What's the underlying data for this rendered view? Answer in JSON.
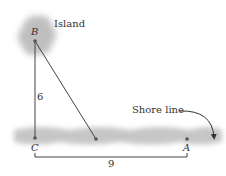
{
  "diagram": {
    "labels": {
      "island": "Island",
      "shore_line": "Shore line",
      "point_b": "B",
      "point_c": "C",
      "point_a": "A",
      "side_bc": "6",
      "side_ca": "9"
    },
    "colors": {
      "line": "#444444",
      "island": "#bdbdbd",
      "shore": "#c4c4c4",
      "text": "#333333"
    }
  }
}
